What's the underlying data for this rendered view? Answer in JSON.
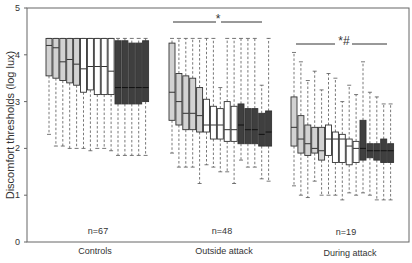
{
  "chart_data": {
    "type": "box",
    "title": "",
    "xlabel": "",
    "ylabel": "Discomfort thresholds (log lux)",
    "ylim": [
      0,
      5
    ],
    "yticks": [
      0,
      1,
      2,
      3,
      4,
      5
    ],
    "grid": false,
    "categories": [
      "Controls",
      "Outside attack",
      "During attack"
    ],
    "groups": [
      {
        "name": "Controls",
        "n_label": "n=67",
        "boxes": [
          {
            "shade": "light",
            "whislo": 2.3,
            "q1": 3.55,
            "med": 4.2,
            "q3": 4.35,
            "whishi": 4.35
          },
          {
            "shade": "light",
            "whislo": 2.05,
            "q1": 3.5,
            "med": 4.15,
            "q3": 4.35,
            "whishi": 4.35
          },
          {
            "shade": "light",
            "whislo": 2.05,
            "q1": 3.45,
            "med": 3.85,
            "q3": 4.35,
            "whishi": 4.35
          },
          {
            "shade": "light",
            "whislo": 2.0,
            "q1": 3.4,
            "med": 3.9,
            "q3": 4.35,
            "whishi": 4.35
          },
          {
            "shade": "light",
            "whislo": 2.0,
            "q1": 3.35,
            "med": 3.8,
            "q3": 4.35,
            "whishi": 4.35
          },
          {
            "shade": "white",
            "whislo": 2.0,
            "q1": 3.2,
            "med": 3.7,
            "q3": 4.35,
            "whishi": 4.35
          },
          {
            "shade": "white",
            "whislo": 1.95,
            "q1": 3.25,
            "med": 3.75,
            "q3": 4.35,
            "whishi": 4.35
          },
          {
            "shade": "white",
            "whislo": 2.0,
            "q1": 3.15,
            "med": 3.75,
            "q3": 4.35,
            "whishi": 4.35
          },
          {
            "shade": "white",
            "whislo": 2.0,
            "q1": 3.15,
            "med": 3.75,
            "q3": 4.35,
            "whishi": 4.35
          },
          {
            "shade": "white",
            "whislo": 1.95,
            "q1": 3.15,
            "med": 3.65,
            "q3": 4.35,
            "whishi": 4.35
          },
          {
            "shade": "dark",
            "whislo": 1.85,
            "q1": 2.95,
            "med": 3.3,
            "q3": 4.3,
            "whishi": 4.35
          },
          {
            "shade": "dark",
            "whislo": 1.85,
            "q1": 2.95,
            "med": 3.3,
            "q3": 4.3,
            "whishi": 4.35
          },
          {
            "shade": "dark",
            "whislo": 1.85,
            "q1": 2.95,
            "med": 3.3,
            "q3": 4.25,
            "whishi": 4.35
          },
          {
            "shade": "dark",
            "whislo": 1.85,
            "q1": 2.95,
            "med": 3.3,
            "q3": 4.25,
            "whishi": 4.35
          },
          {
            "shade": "dark",
            "whislo": 1.85,
            "q1": 3.0,
            "med": 3.3,
            "q3": 4.3,
            "whishi": 4.35
          }
        ]
      },
      {
        "name": "Outside attack",
        "n_label": "n=48",
        "significance": "*",
        "boxes": [
          {
            "shade": "light",
            "whislo": 1.9,
            "q1": 2.6,
            "med": 3.2,
            "q3": 4.25,
            "whishi": 4.35
          },
          {
            "shade": "light",
            "whislo": 1.6,
            "q1": 2.5,
            "med": 3.0,
            "q3": 3.6,
            "whishi": 4.35
          },
          {
            "shade": "light",
            "whislo": 1.6,
            "q1": 2.4,
            "med": 2.75,
            "q3": 3.55,
            "whishi": 4.35
          },
          {
            "shade": "light",
            "whislo": 1.6,
            "q1": 2.4,
            "med": 2.75,
            "q3": 3.5,
            "whishi": 4.35
          },
          {
            "shade": "light",
            "whislo": 1.25,
            "q1": 2.35,
            "med": 2.7,
            "q3": 3.3,
            "whishi": 4.35
          },
          {
            "shade": "white",
            "whislo": 1.65,
            "q1": 2.35,
            "med": 2.5,
            "q3": 3.05,
            "whishi": 4.35
          },
          {
            "shade": "white",
            "whislo": 1.6,
            "q1": 2.2,
            "med": 2.5,
            "q3": 2.9,
            "whishi": 4.35
          },
          {
            "shade": "white",
            "whislo": 1.5,
            "q1": 2.2,
            "med": 2.5,
            "q3": 2.85,
            "whishi": 3.3
          },
          {
            "shade": "white",
            "whislo": 1.5,
            "q1": 2.15,
            "med": 2.4,
            "q3": 3.0,
            "whishi": 4.35
          },
          {
            "shade": "white",
            "whislo": 1.25,
            "q1": 2.15,
            "med": 2.4,
            "q3": 2.9,
            "whishi": 4.35
          },
          {
            "shade": "dark",
            "whislo": 1.75,
            "q1": 2.1,
            "med": 2.5,
            "q3": 2.95,
            "whishi": 4.35
          },
          {
            "shade": "dark",
            "whislo": 1.6,
            "q1": 2.1,
            "med": 2.4,
            "q3": 2.85,
            "whishi": 4.35
          },
          {
            "shade": "dark",
            "whislo": 1.6,
            "q1": 2.1,
            "med": 2.4,
            "q3": 2.85,
            "whishi": 4.35
          },
          {
            "shade": "dark",
            "whislo": 1.35,
            "q1": 2.05,
            "med": 2.3,
            "q3": 2.75,
            "whishi": 3.35
          },
          {
            "shade": "dark",
            "whislo": 1.3,
            "q1": 2.05,
            "med": 2.35,
            "q3": 2.8,
            "whishi": 4.35
          }
        ]
      },
      {
        "name": "During attack",
        "n_label": "n=19",
        "significance": "*#",
        "boxes": [
          {
            "shade": "light",
            "whislo": 1.2,
            "q1": 2.05,
            "med": 2.45,
            "q3": 3.1,
            "whishi": 4.05
          },
          {
            "shade": "light",
            "whislo": 1.0,
            "q1": 1.9,
            "med": 2.2,
            "q3": 2.7,
            "whishi": 3.85
          },
          {
            "shade": "light",
            "whislo": 0.95,
            "q1": 1.85,
            "med": 2.1,
            "q3": 2.5,
            "whishi": 3.45
          },
          {
            "shade": "light",
            "whislo": 1.3,
            "q1": 1.9,
            "med": 2.0,
            "q3": 2.45,
            "whishi": 3.65
          },
          {
            "shade": "light",
            "whislo": 1.0,
            "q1": 1.75,
            "med": 1.95,
            "q3": 2.45,
            "whishi": 3.25
          },
          {
            "shade": "white",
            "whislo": 1.0,
            "q1": 1.85,
            "med": 2.2,
            "q3": 2.5,
            "whishi": 3.6
          },
          {
            "shade": "white",
            "whislo": 1.0,
            "q1": 1.7,
            "med": 2.2,
            "q3": 2.35,
            "whishi": 3.5
          },
          {
            "shade": "white",
            "whislo": 0.9,
            "q1": 1.7,
            "med": 2.2,
            "q3": 2.3,
            "whishi": 3.0
          },
          {
            "shade": "white",
            "whislo": 1.05,
            "q1": 1.65,
            "med": 2.05,
            "q3": 2.2,
            "whishi": 3.35
          },
          {
            "shade": "white",
            "whislo": 1.0,
            "q1": 1.7,
            "med": 2.0,
            "q3": 2.15,
            "whishi": 3.15
          },
          {
            "shade": "dark",
            "whislo": 1.05,
            "q1": 1.75,
            "med": 2.0,
            "q3": 2.6,
            "whishi": 3.85
          },
          {
            "shade": "dark",
            "whislo": 1.0,
            "q1": 1.8,
            "med": 1.95,
            "q3": 2.1,
            "whishi": 3.2
          },
          {
            "shade": "dark",
            "whislo": 0.9,
            "q1": 1.75,
            "med": 1.95,
            "q3": 2.1,
            "whishi": 3.1
          },
          {
            "shade": "dark",
            "whislo": 0.9,
            "q1": 1.7,
            "med": 1.95,
            "q3": 2.2,
            "whishi": 2.95
          },
          {
            "shade": "dark",
            "whislo": 0.9,
            "q1": 1.7,
            "med": 1.95,
            "q3": 2.1,
            "whishi": 2.95
          }
        ]
      }
    ],
    "shade_colors": {
      "light": "#d2d2d2",
      "white": "#ffffff",
      "dark": "#3f3f3f"
    },
    "layout": {
      "frame": {
        "left": 27,
        "top": 8,
        "right": 409,
        "bottom": 242
      },
      "group_start_x": [
        46,
        169,
        291
      ],
      "box_spacing": 6.9,
      "box_width": 6,
      "significance_bars": [
        {
          "group": 1,
          "y": 22,
          "x1": 173,
          "x2": 216,
          "x3": 221,
          "x4": 262,
          "label_x": 218,
          "label_y": 20
        },
        {
          "group": 2,
          "y": 44,
          "x1": 296,
          "x2": 335,
          "x3": 352,
          "x4": 387,
          "label_x": 343,
          "label_y": 42
        }
      ]
    }
  },
  "axis": {
    "ylabel": "Discomfort thresholds (log lux)",
    "ytick_labels": [
      "0",
      "1",
      "2",
      "3",
      "4",
      "5"
    ]
  },
  "labels": {
    "controls": "Controls",
    "outside": "Outside attack",
    "during": "During attack",
    "n_controls": "n=67",
    "n_outside": "n=48",
    "n_during": "n=19",
    "sig_outside": "*",
    "sig_during": "*#"
  }
}
